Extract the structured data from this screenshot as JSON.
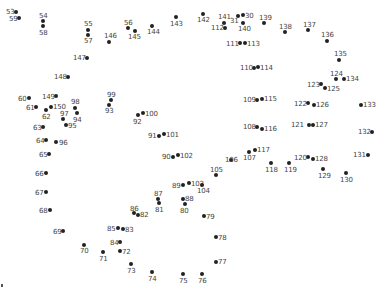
{
  "puzzle": {
    "type": "connect-the-dots",
    "dot_color": "#222222",
    "label_color": "#444444",
    "points": [
      {
        "n": "53",
        "x": 16,
        "y": 12,
        "lx": 6,
        "ly": 8
      },
      {
        "n": "59",
        "x": 19,
        "y": 18,
        "lx": 9,
        "ly": 15
      },
      {
        "n": "54",
        "x": 43,
        "y": 21,
        "lx": 39,
        "ly": 12
      },
      {
        "n": "58",
        "x": 43,
        "y": 26,
        "lx": 39,
        "ly": 29
      },
      {
        "n": "55",
        "x": 88,
        "y": 30,
        "lx": 84,
        "ly": 20
      },
      {
        "n": "57",
        "x": 88,
        "y": 35,
        "lx": 84,
        "ly": 37
      },
      {
        "n": "56",
        "x": 128,
        "y": 28,
        "lx": 124,
        "ly": 19
      },
      {
        "n": "145",
        "x": 135,
        "y": 31,
        "lx": 128,
        "ly": 33
      },
      {
        "n": "146",
        "x": 109,
        "y": 42,
        "lx": 104,
        "ly": 32
      },
      {
        "n": "144",
        "x": 152,
        "y": 26,
        "lx": 147,
        "ly": 28
      },
      {
        "n": "143",
        "x": 176,
        "y": 17,
        "lx": 170,
        "ly": 20
      },
      {
        "n": "142",
        "x": 203,
        "y": 14,
        "lx": 197,
        "ly": 16
      },
      {
        "n": "141",
        "x": 224,
        "y": 23,
        "lx": 218,
        "ly": 13
      },
      {
        "n": "112",
        "x": 225,
        "y": 28,
        "lx": 211,
        "ly": 24
      },
      {
        "n": "31",
        "x": 238,
        "y": 16,
        "lx": 230,
        "ly": 17
      },
      {
        "n": "30",
        "x": 243,
        "y": 15,
        "lx": 245,
        "ly": 12
      },
      {
        "n": "140",
        "x": 243,
        "y": 23,
        "lx": 238,
        "ly": 25
      },
      {
        "n": "139",
        "x": 264,
        "y": 23,
        "lx": 259,
        "ly": 14
      },
      {
        "n": "138",
        "x": 285,
        "y": 32,
        "lx": 279,
        "ly": 23
      },
      {
        "n": "137",
        "x": 308,
        "y": 30,
        "lx": 303,
        "ly": 21
      },
      {
        "n": "136",
        "x": 327,
        "y": 41,
        "lx": 321,
        "ly": 31
      },
      {
        "n": "135",
        "x": 339,
        "y": 60,
        "lx": 334,
        "ly": 50
      },
      {
        "n": "124",
        "x": 336,
        "y": 79,
        "lx": 330,
        "ly": 70
      },
      {
        "n": "134",
        "x": 344,
        "y": 79,
        "lx": 346,
        "ly": 75
      },
      {
        "n": "123",
        "x": 321,
        "y": 84,
        "lx": 307,
        "ly": 81
      },
      {
        "n": "125",
        "x": 325,
        "y": 88,
        "lx": 327,
        "ly": 85
      },
      {
        "n": "111",
        "x": 240,
        "y": 43,
        "lx": 226,
        "ly": 40
      },
      {
        "n": "113",
        "x": 245,
        "y": 43,
        "lx": 247,
        "ly": 40
      },
      {
        "n": "110",
        "x": 254,
        "y": 68,
        "lx": 240,
        "ly": 64
      },
      {
        "n": "114",
        "x": 258,
        "y": 67,
        "lx": 260,
        "ly": 64
      },
      {
        "n": "147",
        "x": 87,
        "y": 58,
        "lx": 73,
        "ly": 54
      },
      {
        "n": "148",
        "x": 68,
        "y": 77,
        "lx": 54,
        "ly": 73
      },
      {
        "n": "60",
        "x": 29,
        "y": 98,
        "lx": 18,
        "ly": 95
      },
      {
        "n": "149",
        "x": 56,
        "y": 96,
        "lx": 42,
        "ly": 93
      },
      {
        "n": "61",
        "x": 36,
        "y": 107,
        "lx": 26,
        "ly": 104
      },
      {
        "n": "150",
        "x": 51,
        "y": 107,
        "lx": 53,
        "ly": 103
      },
      {
        "n": "62",
        "x": 46,
        "y": 110,
        "lx": 42,
        "ly": 113
      },
      {
        "n": "98",
        "x": 75,
        "y": 108,
        "lx": 71,
        "ly": 98
      },
      {
        "n": "97",
        "x": 63,
        "y": 119,
        "lx": 60,
        "ly": 110
      },
      {
        "n": "94",
        "x": 77,
        "y": 113,
        "lx": 73,
        "ly": 116
      },
      {
        "n": "95",
        "x": 66,
        "y": 125,
        "lx": 68,
        "ly": 122
      },
      {
        "n": "63",
        "x": 43,
        "y": 127,
        "lx": 33,
        "ly": 124
      },
      {
        "n": "64",
        "x": 46,
        "y": 140,
        "lx": 36,
        "ly": 137
      },
      {
        "n": "96",
        "x": 56,
        "y": 142,
        "lx": 59,
        "ly": 139
      },
      {
        "n": "65",
        "x": 49,
        "y": 154,
        "lx": 39,
        "ly": 151
      },
      {
        "n": "99",
        "x": 111,
        "y": 100,
        "lx": 107,
        "ly": 91
      },
      {
        "n": "93",
        "x": 109,
        "y": 105,
        "lx": 105,
        "ly": 107
      },
      {
        "n": "92",
        "x": 138,
        "y": 115,
        "lx": 133,
        "ly": 118
      },
      {
        "n": "100",
        "x": 143,
        "y": 113,
        "lx": 145,
        "ly": 110
      },
      {
        "n": "91",
        "x": 159,
        "y": 136,
        "lx": 148,
        "ly": 132
      },
      {
        "n": "101",
        "x": 164,
        "y": 134,
        "lx": 166,
        "ly": 131
      },
      {
        "n": "90",
        "x": 173,
        "y": 157,
        "lx": 162,
        "ly": 153
      },
      {
        "n": "102",
        "x": 178,
        "y": 155,
        "lx": 180,
        "ly": 152
      },
      {
        "n": "109",
        "x": 257,
        "y": 100,
        "lx": 243,
        "ly": 96
      },
      {
        "n": "115",
        "x": 262,
        "y": 99,
        "lx": 264,
        "ly": 95
      },
      {
        "n": "108",
        "x": 257,
        "y": 127,
        "lx": 243,
        "ly": 123
      },
      {
        "n": "116",
        "x": 262,
        "y": 129,
        "lx": 264,
        "ly": 125
      },
      {
        "n": "122",
        "x": 308,
        "y": 103,
        "lx": 294,
        "ly": 100
      },
      {
        "n": "126",
        "x": 314,
        "y": 105,
        "lx": 316,
        "ly": 101
      },
      {
        "n": "133",
        "x": 361,
        "y": 105,
        "lx": 363,
        "ly": 101
      },
      {
        "n": "121",
        "x": 309,
        "y": 125,
        "lx": 291,
        "ly": 121
      },
      {
        "n": "127",
        "x": 313,
        "y": 125,
        "lx": 315,
        "ly": 121
      },
      {
        "n": "132",
        "x": 372,
        "y": 132,
        "lx": 358,
        "ly": 128
      },
      {
        "n": "117",
        "x": 255,
        "y": 150,
        "lx": 257,
        "ly": 146
      },
      {
        "n": "107",
        "x": 249,
        "y": 152,
        "lx": 243,
        "ly": 154
      },
      {
        "n": "106",
        "x": 231,
        "y": 160,
        "lx": 225,
        "ly": 156
      },
      {
        "n": "105",
        "x": 216,
        "y": 175,
        "lx": 210,
        "ly": 166
      },
      {
        "n": "118",
        "x": 271,
        "y": 163,
        "lx": 265,
        "ly": 166
      },
      {
        "n": "119",
        "x": 289,
        "y": 163,
        "lx": 284,
        "ly": 166
      },
      {
        "n": "120",
        "x": 308,
        "y": 157,
        "lx": 294,
        "ly": 154
      },
      {
        "n": "128",
        "x": 313,
        "y": 159,
        "lx": 315,
        "ly": 155
      },
      {
        "n": "129",
        "x": 323,
        "y": 169,
        "lx": 318,
        "ly": 172
      },
      {
        "n": "130",
        "x": 346,
        "y": 173,
        "lx": 340,
        "ly": 176
      },
      {
        "n": "131",
        "x": 368,
        "y": 155,
        "lx": 353,
        "ly": 151
      },
      {
        "n": "66",
        "x": 46,
        "y": 173,
        "lx": 35,
        "ly": 170
      },
      {
        "n": "67",
        "x": 46,
        "y": 192,
        "lx": 35,
        "ly": 189
      },
      {
        "n": "68",
        "x": 50,
        "y": 210,
        "lx": 39,
        "ly": 207
      },
      {
        "n": "69",
        "x": 63,
        "y": 231,
        "lx": 53,
        "ly": 228
      },
      {
        "n": "70",
        "x": 84,
        "y": 245,
        "lx": 80,
        "ly": 247
      },
      {
        "n": "71",
        "x": 103,
        "y": 252,
        "lx": 99,
        "ly": 255
      },
      {
        "n": "85",
        "x": 118,
        "y": 228,
        "lx": 107,
        "ly": 225
      },
      {
        "n": "83",
        "x": 123,
        "y": 229,
        "lx": 125,
        "ly": 226
      },
      {
        "n": "84",
        "x": 120,
        "y": 242,
        "lx": 110,
        "ly": 239
      },
      {
        "n": "72",
        "x": 120,
        "y": 251,
        "lx": 122,
        "ly": 248
      },
      {
        "n": "73",
        "x": 131,
        "y": 264,
        "lx": 127,
        "ly": 267
      },
      {
        "n": "74",
        "x": 152,
        "y": 272,
        "lx": 148,
        "ly": 275
      },
      {
        "n": "75",
        "x": 183,
        "y": 274,
        "lx": 179,
        "ly": 277
      },
      {
        "n": "76",
        "x": 202,
        "y": 274,
        "lx": 198,
        "ly": 277
      },
      {
        "n": "77",
        "x": 216,
        "y": 262,
        "lx": 218,
        "ly": 258
      },
      {
        "n": "78",
        "x": 216,
        "y": 237,
        "lx": 218,
        "ly": 234
      },
      {
        "n": "79",
        "x": 204,
        "y": 216,
        "lx": 206,
        "ly": 213
      },
      {
        "n": "86",
        "x": 134,
        "y": 213,
        "lx": 130,
        "ly": 205
      },
      {
        "n": "82",
        "x": 138,
        "y": 215,
        "lx": 140,
        "ly": 211
      },
      {
        "n": "87",
        "x": 158,
        "y": 199,
        "lx": 154,
        "ly": 190
      },
      {
        "n": "81",
        "x": 159,
        "y": 203,
        "lx": 155,
        "ly": 206
      },
      {
        "n": "88",
        "x": 183,
        "y": 199,
        "lx": 185,
        "ly": 195
      },
      {
        "n": "80",
        "x": 185,
        "y": 204,
        "lx": 180,
        "ly": 207
      },
      {
        "n": "89",
        "x": 183,
        "y": 185,
        "lx": 172,
        "ly": 182
      },
      {
        "n": "103",
        "x": 189,
        "y": 183,
        "lx": 191,
        "ly": 180
      },
      {
        "n": "104",
        "x": 202,
        "y": 185,
        "lx": 197,
        "ly": 187
      }
    ],
    "edge_mark": {
      "x": 2,
      "y": 285
    }
  }
}
